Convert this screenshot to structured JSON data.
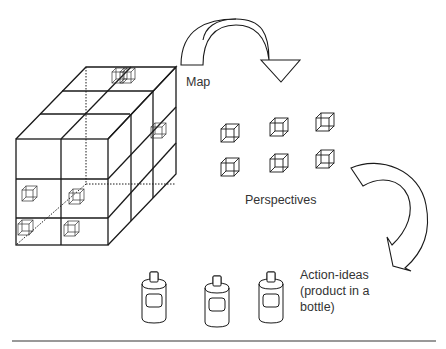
{
  "diagram": {
    "labels": {
      "map": "Map",
      "perspectives": "Perspectives",
      "action_line1": "Action-ideas",
      "action_line2": "(product in a",
      "action_line3": "bottle)"
    },
    "nodes": [
      {
        "id": "cube-grid",
        "name": "Map cube (3x3 grid of cells)"
      },
      {
        "id": "perspectives",
        "name": "Perspectives",
        "count": 6
      },
      {
        "id": "action-ideas",
        "name": "Action-ideas (product in a bottle)",
        "count": 3
      }
    ],
    "edges": [
      {
        "from": "cube-grid",
        "to": "perspectives",
        "style": "curved-arrow"
      },
      {
        "from": "perspectives",
        "to": "action-ideas",
        "style": "curved-arrow"
      }
    ],
    "colors": {
      "stroke": "#1a1a1a",
      "text": "#333333",
      "rule": "#777777"
    }
  }
}
